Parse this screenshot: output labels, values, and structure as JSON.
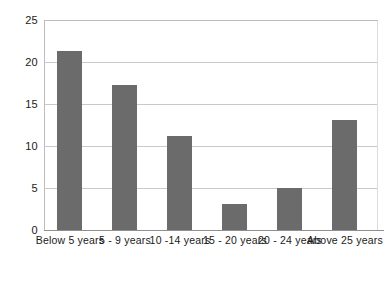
{
  "chart_data": {
    "type": "bar",
    "title": "",
    "subtitle": "",
    "xlabel": "",
    "ylabel": "",
    "categories": [
      "Below 5 years",
      "5 - 9 years",
      "10 -14 years",
      "15 - 20 years",
      "20 - 24 years",
      "Above 25 years"
    ],
    "values": [
      21.3,
      17.3,
      11.2,
      3.1,
      5.0,
      13.1
    ],
    "ylim": [
      0,
      25
    ],
    "ytick_labels": [
      "25",
      "20",
      "15",
      "10",
      "5",
      "0"
    ],
    "ytick_values": [
      25,
      20,
      15,
      10,
      5,
      0
    ],
    "grid": true,
    "grid_axis": "y",
    "legend": false,
    "legend_position": "none",
    "bar_color": "#6b6b6b",
    "grid_color": "#c9c9c9",
    "axis_color": "#8f8f8f",
    "background_color": "#ffffff",
    "text_color": "#1a1a1a"
  }
}
